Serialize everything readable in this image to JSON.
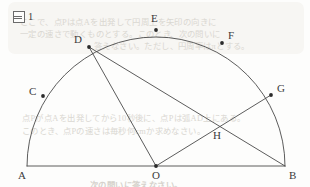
{
  "figure": {
    "caption_marker_icon": "boxed-figure-icon",
    "caption_number": "1",
    "caption_text": "図 1",
    "width": 310,
    "height": 187,
    "stroke_color": "#4a4a4a",
    "background_color": "#fdfdfc",
    "label_color": "#3b3b3b"
  },
  "geometry": {
    "type": "semicircle-diagram",
    "center": {
      "name": "O",
      "x": 156,
      "y": 166
    },
    "radius": 129,
    "diameter_endpoints": [
      "A",
      "B"
    ],
    "points": [
      {
        "label": "A",
        "x": 27,
        "y": 166,
        "label_x": 18,
        "label_y": 170,
        "on": "diameter-left-end",
        "dot": false
      },
      {
        "label": "B",
        "x": 285,
        "y": 166,
        "label_x": 289,
        "label_y": 170,
        "on": "diameter-right-end",
        "dot": false
      },
      {
        "label": "O",
        "x": 156,
        "y": 166,
        "label_x": 152,
        "label_y": 170,
        "on": "center",
        "dot": true
      },
      {
        "label": "C",
        "x": 43,
        "y": 96,
        "label_x": 29,
        "label_y": 86,
        "on": "arc",
        "dot": true
      },
      {
        "label": "D",
        "x": 89,
        "y": 47,
        "label_x": 74,
        "label_y": 34,
        "on": "arc",
        "dot": true
      },
      {
        "label": "E",
        "x": 156,
        "y": 30,
        "label_x": 151,
        "label_y": 13,
        "on": "arc",
        "dot": true
      },
      {
        "label": "F",
        "x": 222,
        "y": 43,
        "label_x": 228,
        "label_y": 30,
        "on": "arc",
        "dot": true
      },
      {
        "label": "G",
        "x": 271,
        "y": 95,
        "label_x": 277,
        "label_y": 83,
        "on": "arc",
        "dot": true
      },
      {
        "label": "H",
        "x": 218,
        "y": 126,
        "label_x": 213,
        "label_y": 130,
        "on": "intersection-of-DB-and-OG",
        "dot": false
      }
    ],
    "segments": [
      {
        "name": "diameter-AB",
        "from": "A",
        "to": "B",
        "x1": 27,
        "y1": 166,
        "x2": 285,
        "y2": 166
      },
      {
        "name": "radius-OD",
        "from": "D",
        "to": "O",
        "x1": 89,
        "y1": 47,
        "x2": 156,
        "y2": 166
      },
      {
        "name": "chord-DB",
        "from": "D",
        "to": "B",
        "x1": 89,
        "y1": 47,
        "x2": 285,
        "y2": 166
      },
      {
        "name": "radius-OG",
        "from": "O",
        "to": "G",
        "x1": 156,
        "y1": 166,
        "x2": 271,
        "y2": 95
      }
    ],
    "arc": {
      "name": "semicircular-arc-AB",
      "from": "A",
      "to": "B",
      "sweep": "upper"
    }
  },
  "background_text": {
    "note": "faint bleed-through text from reverse of page",
    "lines": [
      {
        "text": "ここで、点Pは点Aを出発して円周上を矢印の向きに",
        "x": 20,
        "y": 15
      },
      {
        "text": "一定の速さで動くものとする。このとき、次の問いに",
        "x": 20,
        "y": 27
      },
      {
        "text": "答えなさい。ただし、円周率はπとする。",
        "x": 94,
        "y": 39
      },
      {
        "text": "点Pが点Aを出発してから10秒後に、点Pは弧AD上にある。",
        "x": 22,
        "y": 111
      },
      {
        "text": "このとき、点Pの速さは毎秒何cmか求めなさい。",
        "x": 22,
        "y": 124
      },
      {
        "text": "次の問いに答えなさい。",
        "x": 90,
        "y": 178
      }
    ]
  }
}
